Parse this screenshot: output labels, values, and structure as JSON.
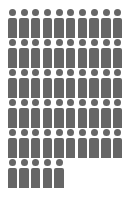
{
  "chart_data": {
    "type": "pictogram",
    "title": "",
    "icon": "person-icon",
    "value": 55,
    "per_row": 10,
    "rows": 6,
    "units_per_icon": 1,
    "color": "#666666",
    "legend": []
  }
}
